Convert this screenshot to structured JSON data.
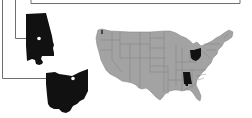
{
  "diagram": {
    "type": "map-callout",
    "colors": {
      "background": "#ffffff",
      "map_fill": "#a3a3a3",
      "map_border": "#7d7d7d",
      "highlight_fill": "#111111",
      "connector": "#6e6e6e",
      "marker": "#ffffff"
    },
    "highlighted_states": [
      {
        "name": "Alabama",
        "callout": "enlarged-silhouette-upper-left"
      },
      {
        "name": "Ohio",
        "callout": "enlarged-silhouette-lower-left"
      }
    ],
    "top_frame": {
      "visible": true
    }
  }
}
